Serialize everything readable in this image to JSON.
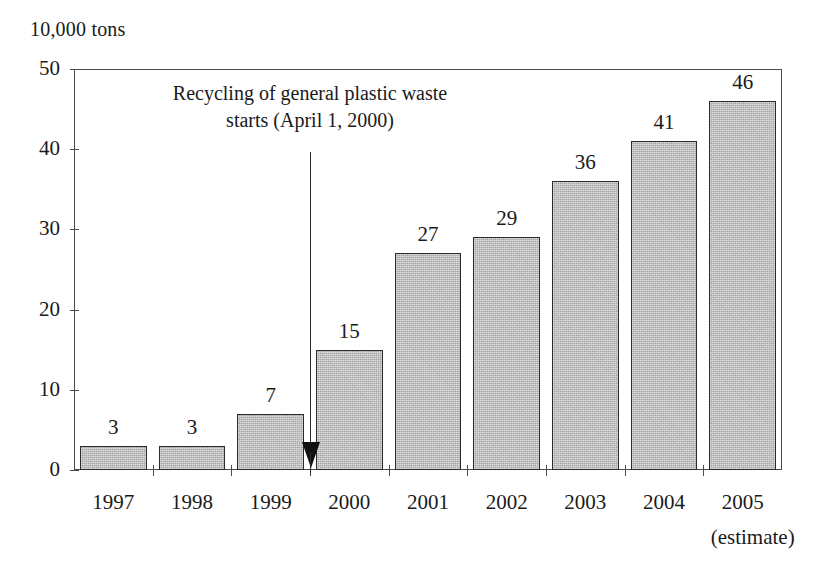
{
  "chart_data": {
    "type": "bar",
    "title": "",
    "unit_label": "10,000 tons",
    "xlabel": "",
    "ylabel": "10,000 tons",
    "categories": [
      "1997",
      "1998",
      "1999",
      "2000",
      "2001",
      "2002",
      "2003",
      "2004",
      "2005"
    ],
    "values": [
      3,
      3,
      7,
      15,
      27,
      29,
      36,
      41,
      46
    ],
    "value_labels": [
      "3",
      "3",
      "7",
      "15",
      "27",
      "29",
      "36",
      "41",
      "46"
    ],
    "ylim": [
      0,
      50
    ],
    "y_ticks": [
      0,
      10,
      20,
      30,
      40,
      50
    ],
    "y_tick_labels": [
      "0",
      "10",
      "20",
      "30",
      "40",
      "50"
    ],
    "grid": false,
    "legend": null,
    "annotations": [
      {
        "text": "Recycling of general plastic waste\nstarts (April 1, 2000)",
        "points_to_category": "2000",
        "arrow": "down"
      },
      {
        "text": "(estimate)",
        "attached_to_category": "2005"
      }
    ],
    "bar_fill_color": "#a9a9a9",
    "bar_border_color": "#2b2b2b",
    "axis_color": "#4a4a4a",
    "text_color": "#1a1a1a",
    "background_color": "#ffffff"
  },
  "labels": {
    "estimate_note": "(estimate)",
    "annotation_main": "Recycling of general plastic waste\nstarts (April 1, 2000)"
  }
}
